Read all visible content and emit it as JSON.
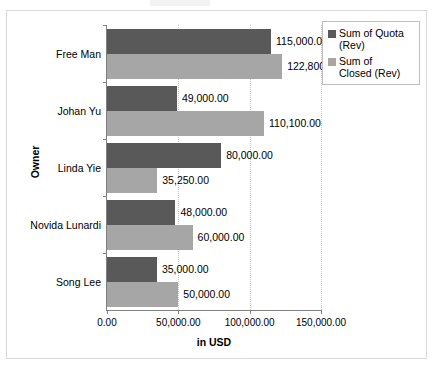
{
  "chart_data": {
    "type": "bar",
    "orientation": "horizontal",
    "title": "",
    "xlabel": "in USD",
    "ylabel": "Owner",
    "categories": [
      "Free Man",
      "Johan Yu",
      "Linda Yie",
      "Novida Lunardi",
      "Song Lee"
    ],
    "series": [
      {
        "name": "Sum of Quota (Rev)",
        "color": "#595959",
        "values": [
          115000.0,
          49000.0,
          80000.0,
          48000.0,
          35000.0
        ],
        "value_labels": [
          "115,000.00",
          "49,000.00",
          "80,000.00",
          "48,000.00",
          "35,000.00"
        ]
      },
      {
        "name": "Sum of Closed (Rev)",
        "color": "#a6a6a6",
        "values": [
          122800.0,
          110100.0,
          35250.0,
          60000.0,
          50000.0
        ],
        "value_labels": [
          "122,800.00",
          "110,100.00",
          "35,250.00",
          "60,000.00",
          "50,000.00"
        ]
      }
    ],
    "xlim": [
      0,
      150000
    ],
    "xticks": [
      0,
      50000,
      100000,
      150000
    ],
    "xtick_labels": [
      "0.00",
      "50,000.00",
      "100,000.00",
      "150,000.00"
    ],
    "grid": true,
    "grid_axis": "x",
    "legend_position": "top-right",
    "legend_entries": [
      {
        "label_line1": "Sum of Quota",
        "label_line2": "(Rev)",
        "label": "Sum of Quota (Rev)",
        "color": "#595959"
      },
      {
        "label_line1": "Sum of",
        "label_line2": "Closed (Rev)",
        "label": "Sum of Closed (Rev)",
        "color": "#a6a6a6"
      }
    ]
  }
}
